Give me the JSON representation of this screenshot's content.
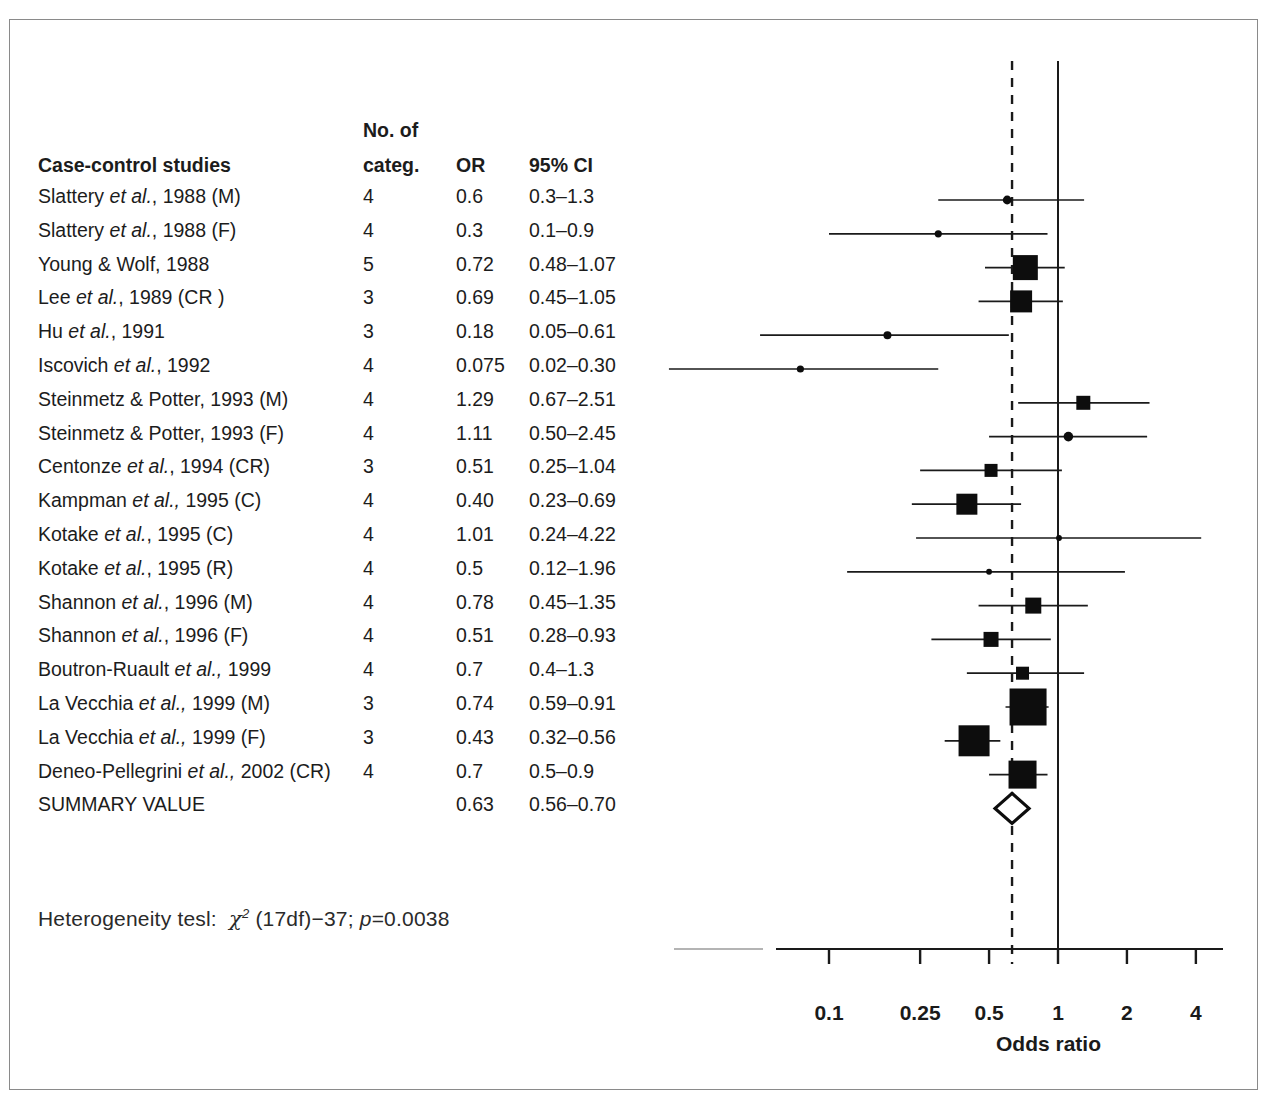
{
  "figure": {
    "table_headers": {
      "no_of": "No. of",
      "study": "Case-control studies",
      "categ": "categ.",
      "or": "OR",
      "ci": "95% CI"
    },
    "heterogeneity": {
      "prefix": "Heterogeneity tesl:",
      "chi": "χ",
      "sup": "2",
      "mid": " (17df)−37; ",
      "p_italic": "p",
      "p_value": "=0.0038"
    },
    "summary_row_label": "SUMMARY VALUE"
  },
  "chart_data": {
    "type": "forest",
    "title": "",
    "xlabel": "Odds ratio",
    "ylabel": "",
    "xscale": "log",
    "xlim": [
      0.06,
      5.2
    ],
    "ticks": [
      0.1,
      0.25,
      0.5,
      1,
      2,
      4
    ],
    "tick_labels": [
      "0.1",
      "0.25",
      "0.5",
      "1",
      "2",
      "4"
    ],
    "reference_line": 1,
    "summary_line": 0.63,
    "grid": false,
    "legend": "none",
    "columns": [
      "Case-control studies",
      "categ.",
      "OR",
      "95% CI"
    ],
    "rows": [
      {
        "study_plain": "Slattery ",
        "study_italic": "et al.",
        "study_tail": ", 1988 (M)",
        "categ": "4",
        "or_label": "0.6",
        "ci_label": "0.3–1.3",
        "or": 0.6,
        "lo": 0.3,
        "hi": 1.3,
        "size": 11
      },
      {
        "study_plain": "Slattery ",
        "study_italic": "et al.",
        "study_tail": ", 1988 (F)",
        "categ": "4",
        "or_label": "0.3",
        "ci_label": "0.1–0.9",
        "or": 0.3,
        "lo": 0.1,
        "hi": 0.9,
        "size": 9
      },
      {
        "study_plain": "Young & Wolf, 1988",
        "study_italic": "",
        "study_tail": "",
        "categ": "5",
        "or_label": "0.72",
        "ci_label": "0.48–1.07",
        "or": 0.72,
        "lo": 0.48,
        "hi": 1.07,
        "size": 25
      },
      {
        "study_plain": "Lee ",
        "study_italic": "et al.",
        "study_tail": ", 1989 (CR )",
        "categ": "3",
        "or_label": "0.69",
        "ci_label": "0.45–1.05",
        "or": 0.69,
        "lo": 0.45,
        "hi": 1.05,
        "size": 22
      },
      {
        "study_plain": "Hu ",
        "study_italic": "et al.",
        "study_tail": ", 1991",
        "categ": "3",
        "or_label": "0.18",
        "ci_label": "0.05–0.61",
        "or": 0.18,
        "lo": 0.05,
        "hi": 0.61,
        "size": 10
      },
      {
        "study_plain": "Iscovich ",
        "study_italic": "et al.",
        "study_tail": ", 1992",
        "categ": "4",
        "or_label": "0.075",
        "ci_label": "0.02–0.30",
        "or": 0.075,
        "lo": 0.02,
        "hi": 0.3,
        "size": 9
      },
      {
        "study_plain": "Steinmetz & Potter, 1993 (M)",
        "study_italic": "",
        "study_tail": "",
        "categ": "4",
        "or_label": "1.29",
        "ci_label": "0.67–2.51",
        "or": 1.29,
        "lo": 0.67,
        "hi": 2.51,
        "size": 14
      },
      {
        "study_plain": "Steinmetz & Potter, 1993 (F)",
        "study_italic": "",
        "study_tail": "",
        "categ": "4",
        "or_label": "1.11",
        "ci_label": "0.50–2.45",
        "or": 1.11,
        "lo": 0.5,
        "hi": 2.45,
        "size": 12
      },
      {
        "study_plain": "Centonze ",
        "study_italic": "et al.",
        "study_tail": ", 1994 (CR)",
        "categ": "3",
        "or_label": "0.51",
        "ci_label": "0.25–1.04",
        "or": 0.51,
        "lo": 0.25,
        "hi": 1.04,
        "size": 13
      },
      {
        "study_plain": "Kampman ",
        "study_italic": "et al.,",
        "study_tail": " 1995 (C)",
        "categ": "4",
        "or_label": "0.40",
        "ci_label": "0.23–0.69",
        "or": 0.4,
        "lo": 0.23,
        "hi": 0.69,
        "size": 21
      },
      {
        "study_plain": "Kotake ",
        "study_italic": "et al.",
        "study_tail": ", 1995 (C)",
        "categ": "4",
        "or_label": "1.01",
        "ci_label": "0.24–4.22",
        "or": 1.01,
        "lo": 0.24,
        "hi": 4.22,
        "size": 7
      },
      {
        "study_plain": "Kotake ",
        "study_italic": "et al.",
        "study_tail": ", 1995 (R)",
        "categ": "4",
        "or_label": "0.5",
        "ci_label": "0.12–1.96",
        "or": 0.5,
        "lo": 0.12,
        "hi": 1.96,
        "size": 7
      },
      {
        "study_plain": "Shannon ",
        "study_italic": "et al.",
        "study_tail": ", 1996 (M)",
        "categ": "4",
        "or_label": "0.78",
        "ci_label": "0.45–1.35",
        "or": 0.78,
        "lo": 0.45,
        "hi": 1.35,
        "size": 16
      },
      {
        "study_plain": "Shannon ",
        "study_italic": "et al.",
        "study_tail": ", 1996 (F)",
        "categ": "4",
        "or_label": "0.51",
        "ci_label": "0.28–0.93",
        "or": 0.51,
        "lo": 0.28,
        "hi": 0.93,
        "size": 15
      },
      {
        "study_plain": "Boutron-Ruault ",
        "study_italic": "et al.,",
        "study_tail": " 1999",
        "categ": "4",
        "or_label": "0.7",
        "ci_label": "0.4–1.3",
        "or": 0.7,
        "lo": 0.4,
        "hi": 1.3,
        "size": 13
      },
      {
        "study_plain": "La Vecchia ",
        "study_italic": "et al.,",
        "study_tail": " 1999 (M)",
        "categ": "3",
        "or_label": "0.74",
        "ci_label": "0.59–0.91",
        "or": 0.74,
        "lo": 0.59,
        "hi": 0.91,
        "size": 37
      },
      {
        "study_plain": "La Vecchia ",
        "study_italic": "et al.,",
        "study_tail": " 1999 (F)",
        "categ": "3",
        "or_label": "0.43",
        "ci_label": "0.32–0.56",
        "or": 0.43,
        "lo": 0.32,
        "hi": 0.56,
        "size": 31
      },
      {
        "study_plain": "Deneo-Pellegrini ",
        "study_italic": "et al.,",
        "study_tail": " 2002 (CR)",
        "categ": "4",
        "or_label": "0.7",
        "ci_label": "0.5–0.9",
        "or": 0.7,
        "lo": 0.5,
        "hi": 0.9,
        "size": 28
      }
    ],
    "summary": {
      "label": "SUMMARY VALUE",
      "categ": "",
      "or_label": "0.63",
      "ci_label": "0.56–0.70",
      "or": 0.63,
      "lo": 0.56,
      "hi": 0.7
    }
  }
}
